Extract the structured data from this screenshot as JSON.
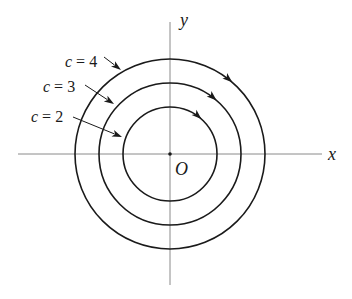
{
  "figure": {
    "type": "level curves / flow lines diagram",
    "center": {
      "x": 170,
      "y": 154
    },
    "axes": {
      "x": {
        "label": "x",
        "from": 18,
        "to": 322
      },
      "y": {
        "label": "y",
        "from": 22,
        "to": 285
      }
    },
    "origin_label": "O",
    "direction": "clockwise",
    "curves": [
      {
        "c_label": "c",
        "equals": "=",
        "value": "2",
        "text": "c = 2",
        "radius": 47,
        "label_pos": {
          "x": 31,
          "y": 122
        },
        "pointer": {
          "x1": 73,
          "y1": 117,
          "x2": 122,
          "y2": 137
        },
        "arrow_angle_deg": 42
      },
      {
        "c_label": "c",
        "equals": "=",
        "value": "3",
        "text": "c = 3",
        "radius": 71,
        "label_pos": {
          "x": 43,
          "y": 92
        },
        "pointer": {
          "x1": 85,
          "y1": 85,
          "x2": 114,
          "y2": 104
        },
        "arrow_angle_deg": 41
      },
      {
        "c_label": "c",
        "equals": "=",
        "value": "4",
        "text": "c = 4",
        "radius": 95,
        "label_pos": {
          "x": 65,
          "y": 67
        },
        "pointer": {
          "x1": 104,
          "y1": 57,
          "x2": 121,
          "y2": 70
        },
        "arrow_angle_deg": 41
      }
    ]
  },
  "colors": {
    "ink": "#1a1a1a",
    "axis": "#8a8a8a",
    "background": "#ffffff"
  }
}
